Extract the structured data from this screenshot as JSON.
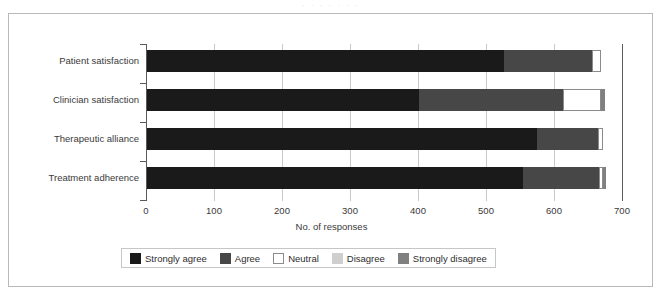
{
  "figure": {
    "scan_artifact_text": "·  ·      ·          ·      ·        ·                        ·"
  },
  "chart_data": {
    "type": "bar",
    "orientation": "horizontal",
    "stacked": true,
    "title": "",
    "xlabel": "No. of responses",
    "ylabel": "",
    "xlim": [
      0,
      700
    ],
    "xticks": [
      0,
      100,
      200,
      300,
      400,
      500,
      600,
      700
    ],
    "xtick_labels": [
      "0",
      "100",
      "200",
      "300",
      "400",
      "500",
      "600",
      "700"
    ],
    "grid": "vertical",
    "legend_position": "bottom",
    "categories": [
      "Patient satisfaction",
      "Clinician satisfaction",
      "Therapeutic alliance",
      "Treatment adherence"
    ],
    "series": [
      {
        "name": "Strongly agree",
        "color": "#1a1a1a",
        "values": [
          525,
          400,
          573,
          553
        ]
      },
      {
        "name": "Agree",
        "color": "#474747",
        "values": [
          130,
          212,
          90,
          112
        ]
      },
      {
        "name": "Neutral",
        "color": "#ffffff",
        "values": [
          13,
          56,
          7,
          5
        ]
      },
      {
        "name": "Disagree",
        "color": "#cfcfcf",
        "values": [
          0,
          0,
          0,
          0
        ]
      },
      {
        "name": "Strongly disagree",
        "color": "#808080",
        "values": [
          0,
          5,
          0,
          5
        ]
      }
    ],
    "totals": [
      668,
      673,
      670,
      675
    ]
  },
  "legend": {
    "items": [
      {
        "label": "Strongly agree",
        "color": "#1a1a1a"
      },
      {
        "label": "Agree",
        "color": "#474747"
      },
      {
        "label": "Neutral",
        "color": "#ffffff"
      },
      {
        "label": "Disagree",
        "color": "#cfcfcf"
      },
      {
        "label": "Strongly disagree",
        "color": "#808080"
      }
    ]
  }
}
